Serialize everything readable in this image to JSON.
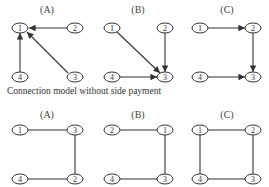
{
  "top_panels": [
    {
      "label": "(A)",
      "nodes": [
        "1",
        "2",
        "3",
        "4"
      ],
      "edges": [
        [
          "2",
          "1"
        ],
        [
          "3",
          "1"
        ],
        [
          "4",
          "1"
        ]
      ],
      "directed": true
    },
    {
      "label": "(B)",
      "nodes": [
        "1",
        "2",
        "3",
        "4"
      ],
      "edges": [
        [
          "1",
          "3"
        ],
        [
          "2",
          "3"
        ],
        [
          "4",
          "3"
        ]
      ],
      "directed": true
    },
    {
      "label": "(C)",
      "nodes": [
        "1",
        "2",
        "3",
        "4"
      ],
      "edges": [
        [
          "1",
          "2"
        ],
        [
          "2",
          "3"
        ],
        [
          "4",
          "3"
        ]
      ],
      "directed": true
    }
  ],
  "caption": "Connection model without side payment",
  "bottom_panels": [
    {
      "label": "(A)",
      "nodes": [
        "1",
        "3",
        "4",
        "2"
      ],
      "edges": [
        [
          "1",
          "3"
        ],
        [
          "3",
          "2"
        ],
        [
          "4",
          "2"
        ]
      ],
      "directed": false
    },
    {
      "label": "(B)",
      "nodes": [
        "2",
        "1",
        "4",
        "3"
      ],
      "edges": [
        [
          "2",
          "1"
        ],
        [
          "1",
          "3"
        ],
        [
          "4",
          "3"
        ]
      ],
      "directed": false
    },
    {
      "label": "(C)",
      "nodes": [
        "1",
        "2",
        "4",
        "3"
      ],
      "edges": [
        [
          "1",
          "2"
        ],
        [
          "2",
          "3"
        ],
        [
          "4",
          "3"
        ],
        [
          "1",
          "4"
        ]
      ],
      "directed": false
    }
  ],
  "colors": {
    "stroke": "#333333",
    "background": "#ffffff"
  }
}
